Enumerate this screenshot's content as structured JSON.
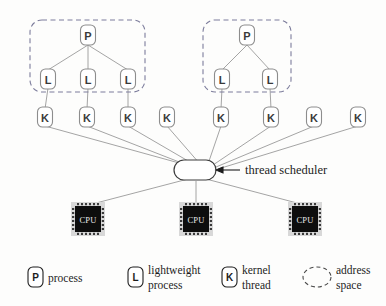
{
  "diagram": {
    "background_color": "#fdfdfc",
    "annotation": {
      "label": "thread scheduler",
      "target": "scheduler-node"
    },
    "scheduler": {
      "name": "thread scheduler",
      "shape": "stadium",
      "x": 195,
      "y": 170,
      "width": 42,
      "height": 20
    },
    "address_space_groups": [
      {
        "id": "address-space-1",
        "x": 30,
        "y": 20,
        "width": 115,
        "height": 72,
        "process_label": "P",
        "lwp_labels": [
          "L",
          "L",
          "L"
        ]
      },
      {
        "id": "address-space-2",
        "x": 203,
        "y": 20,
        "width": 88,
        "height": 72,
        "process_label": "P",
        "lwp_labels": [
          "L",
          "L"
        ]
      }
    ],
    "processes": [
      {
        "label": "P",
        "cx": 88,
        "cy": 35
      },
      {
        "label": "P",
        "cx": 247,
        "cy": 35
      }
    ],
    "lightweight_processes": [
      {
        "label": "L",
        "cx": 48,
        "cy": 79
      },
      {
        "label": "L",
        "cx": 88,
        "cy": 79
      },
      {
        "label": "L",
        "cx": 128,
        "cy": 79
      },
      {
        "label": "L",
        "cx": 222,
        "cy": 79
      },
      {
        "label": "L",
        "cx": 270,
        "cy": 79
      }
    ],
    "kernel_threads": [
      {
        "label": "K",
        "cx": 45,
        "cy": 117
      },
      {
        "label": "K",
        "cx": 87,
        "cy": 117
      },
      {
        "label": "K",
        "cx": 128,
        "cy": 117
      },
      {
        "label": "K",
        "cx": 167,
        "cy": 117
      },
      {
        "label": "K",
        "cx": 221,
        "cy": 117
      },
      {
        "label": "K",
        "cx": 271,
        "cy": 117
      },
      {
        "label": "K",
        "cx": 314,
        "cy": 117
      },
      {
        "label": "K",
        "cx": 358,
        "cy": 117
      }
    ],
    "cpus": [
      {
        "label": "CPU",
        "cx": 88,
        "cy": 219
      },
      {
        "label": "CPU",
        "cx": 196,
        "cy": 219
      },
      {
        "label": "CPU",
        "cx": 305,
        "cy": 219
      }
    ],
    "legend": {
      "items": [
        {
          "id": "legend-process",
          "badge": "P",
          "lines": [
            "process"
          ]
        },
        {
          "id": "legend-lightweight",
          "badge": "L",
          "lines": [
            "lightweight",
            "process"
          ]
        },
        {
          "id": "legend-kernel-thread",
          "badge": "K",
          "lines": [
            "kernel",
            "thread"
          ]
        },
        {
          "id": "legend-address-space",
          "badge": "",
          "lines": [
            "address",
            "space"
          ]
        }
      ]
    },
    "colors": {
      "edge": "#9a9a9a",
      "badge_stroke": "#8d8d8d",
      "group_dash": "#7d7d9c",
      "chip_body": "#0d0d0d",
      "text": "#1d1d1d"
    }
  }
}
